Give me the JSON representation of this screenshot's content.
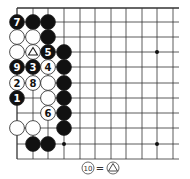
{
  "diagram": {
    "type": "go-board-corner",
    "grid": {
      "x": [
        17,
        33,
        48,
        64,
        80,
        95,
        111,
        126,
        142,
        157,
        173
      ],
      "y": [
        8,
        22,
        37,
        52,
        67,
        83,
        98,
        113,
        128,
        144,
        159
      ],
      "top_edge_row": 0,
      "left_edge_col": 0
    },
    "star_points": [
      [
        9,
        3
      ],
      [
        9,
        9
      ],
      [
        3,
        9
      ]
    ],
    "stones": [
      {
        "col": 0,
        "row": 1,
        "color": "black",
        "label": "7"
      },
      {
        "col": 1,
        "row": 1,
        "color": "black",
        "label": ""
      },
      {
        "col": 2,
        "row": 1,
        "color": "black",
        "label": ""
      },
      {
        "col": 0,
        "row": 2,
        "color": "white",
        "label": ""
      },
      {
        "col": 1,
        "row": 2,
        "color": "white",
        "label": ""
      },
      {
        "col": 2,
        "row": 2,
        "color": "black",
        "label": ""
      },
      {
        "col": 0,
        "row": 3,
        "color": "white",
        "label": ""
      },
      {
        "col": 1,
        "row": 3,
        "color": "white",
        "label": "△"
      },
      {
        "col": 2,
        "row": 3,
        "color": "black",
        "label": "5"
      },
      {
        "col": 3,
        "row": 3,
        "color": "black",
        "label": ""
      },
      {
        "col": 0,
        "row": 4,
        "color": "black",
        "label": "9"
      },
      {
        "col": 1,
        "row": 4,
        "color": "black",
        "label": "3"
      },
      {
        "col": 2,
        "row": 4,
        "color": "white",
        "label": "4"
      },
      {
        "col": 3,
        "row": 4,
        "color": "black",
        "label": ""
      },
      {
        "col": 0,
        "row": 5,
        "color": "white",
        "label": "2"
      },
      {
        "col": 1,
        "row": 5,
        "color": "white",
        "label": "8"
      },
      {
        "col": 2,
        "row": 5,
        "color": "white",
        "label": ""
      },
      {
        "col": 3,
        "row": 5,
        "color": "black",
        "label": ""
      },
      {
        "col": 0,
        "row": 6,
        "color": "black",
        "label": "1"
      },
      {
        "col": 2,
        "row": 6,
        "color": "white",
        "label": ""
      },
      {
        "col": 3,
        "row": 6,
        "color": "black",
        "label": ""
      },
      {
        "col": 2,
        "row": 7,
        "color": "white",
        "label": "6"
      },
      {
        "col": 3,
        "row": 7,
        "color": "black",
        "label": ""
      },
      {
        "col": 0,
        "row": 8,
        "color": "white",
        "label": ""
      },
      {
        "col": 1,
        "row": 8,
        "color": "white",
        "label": ""
      },
      {
        "col": 3,
        "row": 8,
        "color": "black",
        "label": ""
      },
      {
        "col": 1,
        "row": 9,
        "color": "black",
        "label": ""
      },
      {
        "col": 2,
        "row": 9,
        "color": "black",
        "label": ""
      }
    ],
    "caption": {
      "move": "10",
      "equals": "=",
      "target": "△"
    },
    "colors": {
      "line": "#333333",
      "black_stone": "#111111",
      "white_stone": "#ffffff",
      "stone_outline": "#222222"
    }
  }
}
